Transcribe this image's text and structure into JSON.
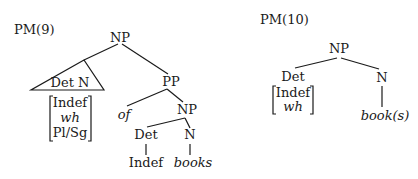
{
  "trees": [
    {
      "label": "PM(9)",
      "root": "NP",
      "triangle_label": "Det N",
      "features": [
        "Indef",
        "wh",
        "Pl/Sg"
      ],
      "pp": {
        "label": "PP",
        "prep": "of",
        "np": {
          "label": "NP",
          "det": "Det",
          "det_value": "Indef",
          "n": "N",
          "n_value": "books"
        }
      }
    },
    {
      "label": "PM(10)",
      "root": "NP",
      "det": "Det",
      "features": [
        "Indef",
        "wh"
      ],
      "n": "N",
      "n_value": "book(s)"
    }
  ]
}
